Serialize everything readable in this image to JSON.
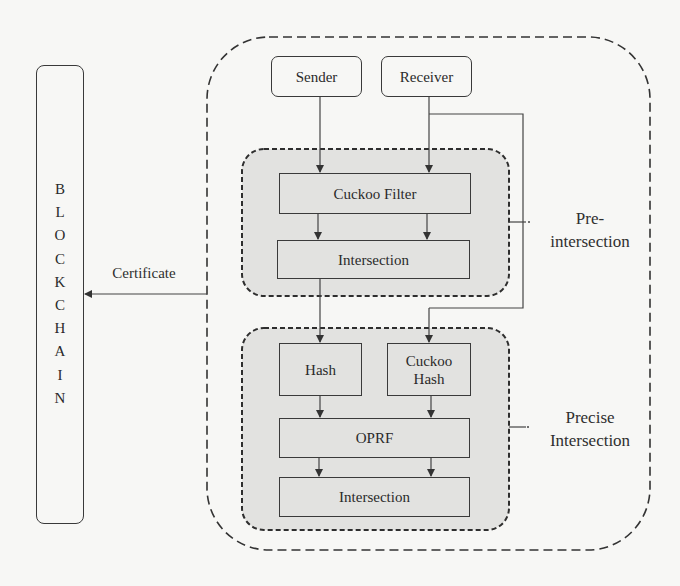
{
  "diagram": {
    "blockchain": {
      "label": "BLOCKCHAIN",
      "letters": [
        "B",
        "L",
        "O",
        "C",
        "K",
        "C",
        "H",
        "A",
        "I",
        "N"
      ]
    },
    "certificate_label": "Certificate",
    "actors": {
      "sender": "Sender",
      "receiver": "Receiver"
    },
    "pre_intersection": {
      "label_line1": "Pre-",
      "label_line2": "intersection",
      "cuckoo_filter": "Cuckoo Filter",
      "intersection": "Intersection"
    },
    "precise_intersection": {
      "label_line1": "Precise",
      "label_line2": "Intersection",
      "hash": "Hash",
      "cuckoo_hash_line1": "Cuckoo",
      "cuckoo_hash_line2": "Hash",
      "oprf": "OPRF",
      "intersection": "Intersection"
    },
    "colors": {
      "panel_fill": "#e2e2e0",
      "stroke": "#3a3a3a",
      "background": "#f7f7f5"
    }
  }
}
